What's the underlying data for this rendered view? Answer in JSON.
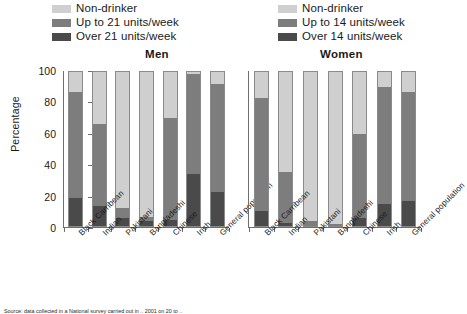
{
  "legends": {
    "men": {
      "items": [
        {
          "label": "Non-drinker",
          "color": "#cfcfcf",
          "key": "non-drinker"
        },
        {
          "label": "Up to 21 units/week",
          "color": "#7d7d7d",
          "key": "up-to"
        },
        {
          "label": "Over 21 units/week",
          "color": "#4a4a4a",
          "key": "over"
        }
      ]
    },
    "women": {
      "items": [
        {
          "label": "Non-drinker",
          "color": "#cfcfcf",
          "key": "non-drinker"
        },
        {
          "label": "Up to 14 units/week",
          "color": "#7d7d7d",
          "key": "up-to"
        },
        {
          "label": "Over 14 units/week",
          "color": "#4a4a4a",
          "key": "over"
        }
      ]
    }
  },
  "axis": {
    "ylabel": "Percentage",
    "yticks": [
      "0",
      "20",
      "40",
      "60",
      "80",
      "100"
    ],
    "ymin": 0,
    "ymax": 100
  },
  "footnote": "Source: data collected in a National survey carried out in .. 2001 on 20 to ..",
  "chart_data": [
    {
      "type": "bar",
      "title": "Men",
      "stacked": true,
      "xlabel": "",
      "ylabel": "Percentage",
      "ylim": [
        0,
        100
      ],
      "grid": false,
      "legend_position": "top-left",
      "categories": [
        "Black Carribean",
        "Indian",
        "Pakistani",
        "Bangladeshi",
        "Chinese",
        "Irish",
        "General population"
      ],
      "series": [
        {
          "name": "Over 21 units/week",
          "color": "#4a4a4a",
          "values": [
            18,
            13,
            5,
            3,
            4,
            34,
            22
          ]
        },
        {
          "name": "Up to 21 units/week",
          "color": "#7d7d7d",
          "values": [
            69,
            53,
            7,
            3,
            66,
            65,
            70
          ]
        },
        {
          "name": "Non-drinker",
          "color": "#cfcfcf",
          "values": [
            13,
            34,
            88,
            94,
            30,
            1,
            8
          ]
        }
      ],
      "segment_tops": {
        "over": [
          18,
          13,
          5,
          3,
          4,
          34,
          22
        ],
        "up_to": [
          87,
          66,
          12,
          6,
          70,
          99,
          92
        ]
      }
    },
    {
      "type": "bar",
      "title": "Women",
      "stacked": true,
      "xlabel": "",
      "ylabel": "Percentage",
      "ylim": [
        0,
        100
      ],
      "grid": false,
      "legend_position": "top-right",
      "categories": [
        "Black Carribean",
        "Indian",
        "Pakistani",
        "Bangladeshi",
        "Chinese",
        "Irish",
        "General population"
      ],
      "series": [
        {
          "name": "Over 14 units/week",
          "color": "#4a4a4a",
          "values": [
            10,
            2,
            0,
            0,
            5,
            14,
            16
          ]
        },
        {
          "name": "Up to 14 units/week",
          "color": "#7d7d7d",
          "values": [
            73,
            33,
            3,
            1,
            55,
            76,
            71
          ]
        },
        {
          "name": "Non-drinker",
          "color": "#cfcfcf",
          "values": [
            17,
            65,
            97,
            99,
            40,
            10,
            13
          ]
        }
      ],
      "segment_tops": {
        "over": [
          10,
          2,
          0,
          0,
          5,
          14,
          16
        ],
        "up_to": [
          83,
          35,
          3,
          1,
          60,
          90,
          87
        ]
      }
    }
  ]
}
